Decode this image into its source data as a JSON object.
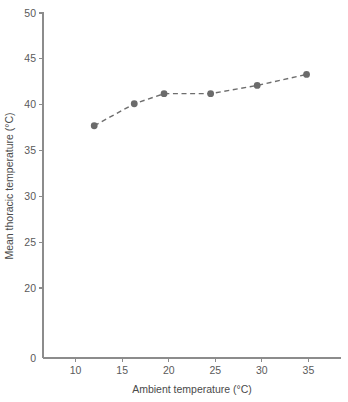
{
  "chart_data": {
    "type": "line",
    "title": "",
    "subtitle": "",
    "xlabel": "Ambient temperature (°C)",
    "ylabel": "Mean thoracic temperature (°C)",
    "xlim": [
      6.5,
      38.5
    ],
    "ylim": [
      0,
      51.5
    ],
    "y_axis_broken": true,
    "y_break_between": [
      0,
      20
    ],
    "grid": false,
    "legend": null,
    "marker": "filled-circle",
    "line_style": "dashed",
    "series_color": "#6b6b6b",
    "xticks": [
      10,
      15,
      20,
      25,
      30,
      35
    ],
    "xtick_labels": [
      "10",
      "15",
      "20",
      "25",
      "30",
      "35"
    ],
    "yticks": [
      0,
      20,
      25,
      30,
      35,
      40,
      45,
      50
    ],
    "ytick_labels": [
      "0",
      "20",
      "25",
      "30",
      "35",
      "40",
      "45",
      "50"
    ],
    "x": [
      12.0,
      16.3,
      19.5,
      24.5,
      29.5,
      34.8
    ],
    "values": [
      37.7,
      40.1,
      41.2,
      41.2,
      42.1,
      43.3
    ],
    "points": [
      {
        "x": 12.0,
        "y": 37.7
      },
      {
        "x": 16.3,
        "y": 40.1
      },
      {
        "x": 19.5,
        "y": 41.2
      },
      {
        "x": 24.5,
        "y": 41.2
      },
      {
        "x": 29.5,
        "y": 42.1
      },
      {
        "x": 34.8,
        "y": 43.3
      }
    ],
    "series": [
      {
        "name": "Mean thoracic temperature",
        "x": [
          12.0,
          16.3,
          19.5,
          24.5,
          29.5,
          34.8
        ],
        "values": [
          37.7,
          40.1,
          41.2,
          41.2,
          42.1,
          43.3
        ]
      }
    ],
    "annotations": []
  }
}
